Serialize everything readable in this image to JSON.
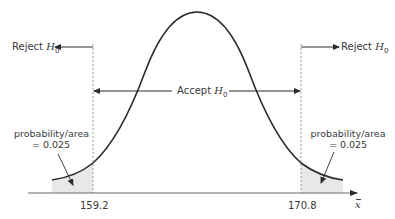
{
  "diagram": {
    "type": "two-tailed hypothesis test on sampling distribution",
    "reject_left": {
      "text": "Reject ",
      "symbol": "H",
      "subscript": "0"
    },
    "reject_right": {
      "text": "Reject ",
      "symbol": "H",
      "subscript": "0"
    },
    "accept": {
      "text": "Accept ",
      "symbol": "H",
      "subscript": "0"
    },
    "left_tail": {
      "line1": "probability/area",
      "line2": "= 0.025"
    },
    "right_tail": {
      "line1": "probability/area",
      "line2": "= 0.025"
    },
    "critical_values": {
      "lower": "159.2",
      "upper": "170.8"
    },
    "axis_label": "x"
  },
  "colors": {
    "curve": "#2b2b2b",
    "text": "#3a3a3a",
    "tail_fill": "#e8e8e8",
    "dashed": "#9a9a9a",
    "axis": "#6a6a6a"
  }
}
